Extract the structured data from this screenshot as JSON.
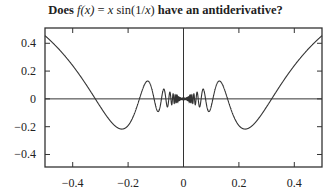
{
  "chart_data": {
    "type": "line",
    "title": "Does f(x) = x sin(1/x) have an antiderivative?",
    "title_parts": {
      "prefix": "Does ",
      "fx": "f(x)",
      "eq": " = ",
      "expr_x": "x",
      "expr_sin": " sin(1/",
      "expr_x2": "x",
      "expr_close": ")",
      "suffix": " have an antiderivative?"
    },
    "xlabel": "",
    "ylabel": "",
    "xlim": [
      -0.5,
      0.5
    ],
    "ylim": [
      -0.49,
      0.51
    ],
    "xticks": [
      -0.4,
      -0.2,
      0,
      0.2,
      0.4
    ],
    "xtick_labels": [
      "−0.4",
      "−0.2",
      "0",
      "0.2",
      "0.4"
    ],
    "yticks": [
      0.4,
      0.2,
      0,
      -0.2,
      -0.4
    ],
    "ytick_labels": [
      "0.4",
      "0.2",
      "0",
      "−0.2",
      "−0.4"
    ],
    "grid": false,
    "legend": null,
    "axes_lines": {
      "x_axis_at_y": 0,
      "y_axis_at_x": 0
    },
    "series": [
      {
        "name": "f(x) = x sin(1/x)",
        "function": "x*sin(1/x)",
        "color": "#333333",
        "x": [
          -0.5,
          -0.45,
          -0.4,
          -0.35,
          -0.318,
          -0.3,
          -0.25,
          -0.225,
          -0.2,
          -0.15,
          -0.13,
          -0.106,
          -0.1,
          -0.08,
          -0.0637,
          -0.05,
          -0.04,
          -0.0318,
          -0.02,
          -0.01,
          0,
          0.01,
          0.02,
          0.0318,
          0.04,
          0.05,
          0.0637,
          0.08,
          0.1,
          0.106,
          0.13,
          0.15,
          0.2,
          0.225,
          0.25,
          0.3,
          0.318,
          0.35,
          0.4,
          0.45,
          0.5
        ],
        "y": [
          0.455,
          0.358,
          0.239,
          0.096,
          0.0,
          -0.052,
          -0.189,
          -0.217,
          -0.192,
          0.056,
          0.13,
          0.0,
          0.054,
          -0.079,
          0.0,
          -0.046,
          0.005,
          0.0,
          0.018,
          0.005,
          0,
          0.005,
          0.018,
          0.0,
          0.005,
          -0.046,
          0.0,
          -0.079,
          0.054,
          0.0,
          0.13,
          0.056,
          -0.192,
          -0.217,
          -0.189,
          -0.052,
          0.0,
          0.096,
          0.239,
          0.358,
          0.455
        ]
      }
    ]
  },
  "colors": {
    "axes": "#333333",
    "curve": "#333333",
    "background": "#ffffff"
  }
}
